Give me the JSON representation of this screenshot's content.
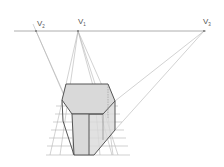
{
  "diagram": {
    "labels": {
      "v2": {
        "text": "V",
        "sub": "2"
      },
      "v1": {
        "text": "V",
        "sub": "1"
      },
      "v3": {
        "text": "V",
        "sub": "3"
      }
    },
    "colors": {
      "background": "#ffffff",
      "horizon": "#9a9a9a",
      "construction": "#b4b4b4",
      "edge": "#555555",
      "face_fill": "#d9d9d9",
      "label": "#555555"
    }
  }
}
